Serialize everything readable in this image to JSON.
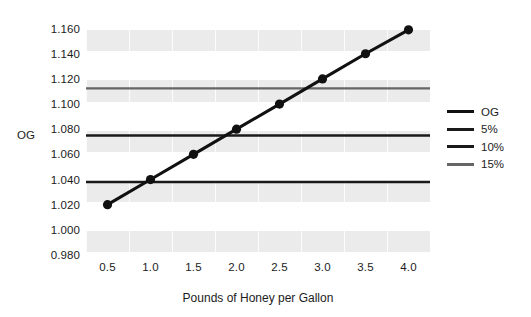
{
  "chart_data": {
    "type": "line",
    "title": "",
    "subtitle": "",
    "xlabel": "Pounds of Honey per Gallon",
    "ylabel": "OG",
    "xlim": [
      0.25,
      4.25
    ],
    "ylim": [
      0.98,
      1.17
    ],
    "grid": true,
    "grid_style": "alternating horizontal gray bands with faint vertical cell dividers",
    "legend_position": "right",
    "x": [
      0.5,
      1.0,
      1.5,
      2.0,
      2.5,
      3.0,
      3.5,
      4.0
    ],
    "xtick_labels": [
      "0.5",
      "1.0",
      "1.5",
      "2.0",
      "2.5",
      "3.0",
      "3.5",
      "4.0"
    ],
    "ytick_values": [
      0.98,
      1.0,
      1.02,
      1.04,
      1.06,
      1.08,
      1.1,
      1.12,
      1.14,
      1.16
    ],
    "ytick_labels": [
      "0.980",
      "1.000",
      "1.020",
      "1.040",
      "1.060",
      "1.080",
      "1.100",
      "1.120",
      "1.140",
      "1.160"
    ],
    "series": [
      {
        "name": "OG",
        "type": "line",
        "color": "#111111",
        "marker": "circle",
        "values": [
          1.02,
          1.04,
          1.06,
          1.08,
          1.1,
          1.12,
          1.14,
          1.159
        ]
      },
      {
        "name": "5%",
        "type": "hline",
        "color": "#1a1a1a",
        "value": 1.038
      },
      {
        "name": "10%",
        "type": "hline",
        "color": "#1a1a1a",
        "value": 1.075
      },
      {
        "name": "15%",
        "type": "hline",
        "color": "#666666",
        "value": 1.1125
      }
    ],
    "legend": [
      {
        "label": "OG",
        "color": "#111111"
      },
      {
        "label": "5%",
        "color": "#1a1a1a"
      },
      {
        "label": "10%",
        "color": "#1a1a1a"
      },
      {
        "label": "15%",
        "color": "#666666"
      }
    ]
  },
  "axes": {
    "y_title": "OG",
    "x_title": "Pounds of Honey per Gallon"
  }
}
